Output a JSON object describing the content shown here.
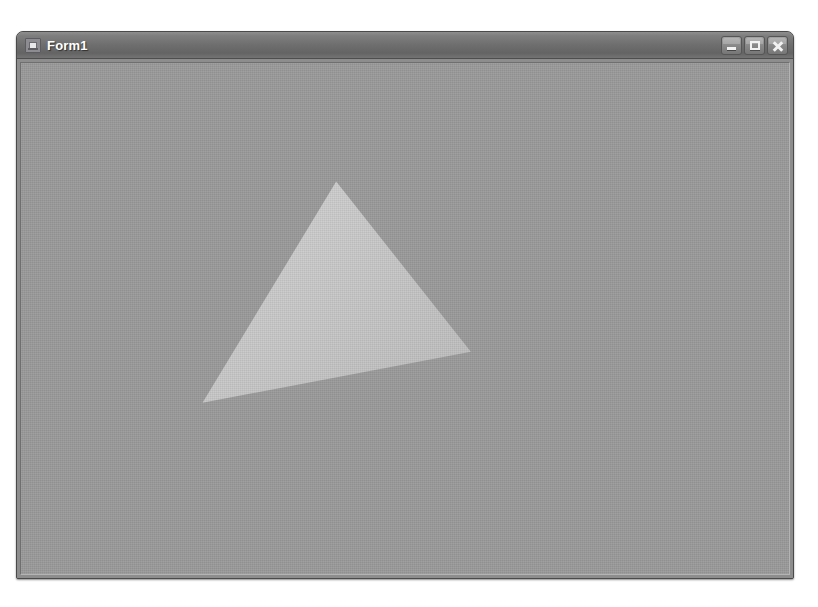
{
  "window": {
    "title": "Form1",
    "icon": "form-window-icon",
    "background_color": "#9a9a9a",
    "titlebar_color": "#6e6e6e",
    "title_text_color": "#ffffff",
    "border_color": "#4a4a4a",
    "bounds": {
      "x": 16,
      "y": 31,
      "width": 778,
      "height": 548
    }
  },
  "caption_buttons": [
    {
      "name": "minimize-button",
      "label": "Minimize",
      "glyph": "minimize-icon"
    },
    {
      "name": "maximize-button",
      "label": "Maximize",
      "glyph": "maximize-icon"
    },
    {
      "name": "close-button",
      "label": "Close",
      "glyph": "close-icon"
    }
  ],
  "client_area": {
    "name": "render-surface",
    "background_color": "#9a9a9a",
    "description": "Rendered 3D viewport showing a single shaded triangle"
  },
  "scene": {
    "shape": "triangle",
    "fill_color": "#c6c6c6",
    "shading": "flat-gouraud",
    "vertices": [
      {
        "label": "apex",
        "x": 337,
        "y": 182
      },
      {
        "label": "right",
        "x": 472,
        "y": 353
      },
      {
        "label": "bottom-left",
        "x": 203,
        "y": 404
      }
    ],
    "gradient_stops": [
      {
        "offset": 0.0,
        "color": "#d2d2d2"
      },
      {
        "offset": 0.55,
        "color": "#c6c6c6"
      },
      {
        "offset": 1.0,
        "color": "#bcbcbc"
      }
    ]
  },
  "page": {
    "background_color": "#ffffff",
    "width": 818,
    "height": 607
  }
}
